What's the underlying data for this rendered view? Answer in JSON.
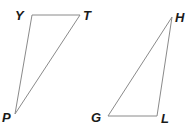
{
  "diagram": {
    "triangles": [
      {
        "name": "triangle-YTP",
        "vertices": [
          {
            "label": "Y",
            "x": 32,
            "y": 15,
            "lx": 15,
            "ly": 20
          },
          {
            "label": "T",
            "x": 80,
            "y": 15,
            "lx": 83,
            "ly": 20
          },
          {
            "label": "P",
            "x": 15,
            "y": 114,
            "lx": 2,
            "ly": 122
          }
        ]
      },
      {
        "name": "triangle-HGL",
        "vertices": [
          {
            "label": "H",
            "x": 172,
            "y": 17,
            "lx": 175,
            "ly": 22
          },
          {
            "label": "G",
            "x": 108,
            "y": 116,
            "lx": 91,
            "ly": 122
          },
          {
            "label": "L",
            "x": 157,
            "y": 116,
            "lx": 161,
            "ly": 123
          }
        ]
      }
    ],
    "colors": {
      "edge": "#8a8a8a",
      "label": "#1a1a1a",
      "background": "#ffffff"
    }
  }
}
